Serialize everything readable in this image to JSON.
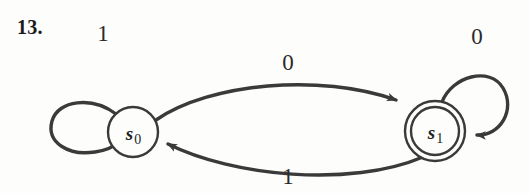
{
  "figure": {
    "exercise_number": "13.",
    "type": "finite-state-machine-diagram",
    "background_color": "#fdfdfc",
    "ink_color": "#3a3a3a"
  },
  "states": [
    {
      "id": "s0",
      "label_symbol": "s",
      "label_subscript": "0",
      "shape": "single-circle",
      "accepting": "false",
      "cx": 133,
      "cy": 132,
      "r": 25
    },
    {
      "id": "s1",
      "label_symbol": "s",
      "label_subscript": "1",
      "shape": "double-circle",
      "accepting": "true",
      "cx": 435,
      "cy": 131,
      "r_outer": 30,
      "r_inner": 24
    }
  ],
  "transitions": [
    {
      "id": "s0-self",
      "from": "s0",
      "to": "s0",
      "label": "1",
      "label_x": 103,
      "label_y": 33,
      "kind": "self-loop-left"
    },
    {
      "id": "s0-to-s1",
      "from": "s0",
      "to": "s1",
      "label": "0",
      "label_x": 288,
      "label_y": 62,
      "kind": "arc-top"
    },
    {
      "id": "s1-to-s0",
      "from": "s1",
      "to": "s0",
      "label": "1",
      "label_x": 288,
      "label_y": 176,
      "kind": "arc-bottom"
    },
    {
      "id": "s1-self",
      "from": "s1",
      "to": "s1",
      "label": "0",
      "label_x": 477,
      "label_y": 36,
      "kind": "self-loop-right"
    }
  ]
}
